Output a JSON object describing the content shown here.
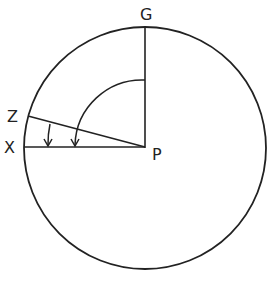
{
  "diagram": {
    "labels": {
      "g": "G",
      "z": "Z",
      "x": "X",
      "p": "P"
    },
    "colors": {
      "ink": "#222222",
      "background": "#ffffff"
    }
  }
}
